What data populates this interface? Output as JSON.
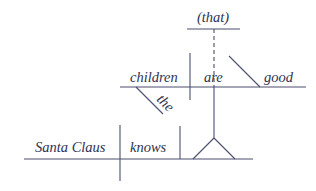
{
  "diagram": {
    "type": "reed-kellogg-sentence-diagram",
    "sentence_words": {
      "main_subject": "Santa Claus",
      "main_verb": "knows",
      "clause_subject": "children",
      "clause_modifier": "the",
      "clause_verb": "are",
      "clause_complement": "good",
      "clause_connector": "(that)"
    },
    "colors": {
      "background": "#ffffff",
      "line": "#4a4f6e",
      "text": "#2e3250"
    }
  }
}
